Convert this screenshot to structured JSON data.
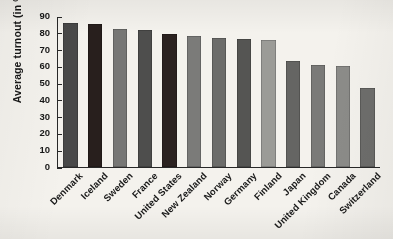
{
  "chart_data": {
    "type": "bar",
    "title": "",
    "xlabel": "",
    "ylabel": "Average turnout (in %)",
    "ylim": [
      0,
      90
    ],
    "yticks": [
      0,
      10,
      20,
      30,
      40,
      50,
      60,
      70,
      80,
      90
    ],
    "grid": false,
    "legend": "none",
    "categories": [
      "Denmark",
      "Iceland",
      "Sweden",
      "France",
      "United States",
      "New Zealand",
      "Norway",
      "Germany",
      "Finland",
      "Japan",
      "United Kingdom",
      "Canada",
      "Switzerland"
    ],
    "values": [
      86,
      85.5,
      82,
      81.5,
      79,
      78,
      77,
      76.5,
      76,
      63,
      61,
      60.5,
      47
    ],
    "bar_colors": [
      "#4a4a4a",
      "#2a211f",
      "#777775",
      "#4f4f4e",
      "#2d2422",
      "#7b7b79",
      "#6c6c6a",
      "#565654",
      "#9a9a97",
      "#666664",
      "#7a7a78",
      "#8c8c89",
      "#6e6e6c"
    ]
  },
  "style": {
    "background": "#f2f0eb",
    "axis_color": "#2a2a2a",
    "text_color": "#1b1b1b"
  }
}
